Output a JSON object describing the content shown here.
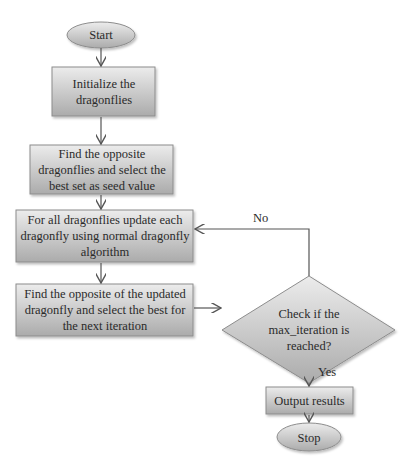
{
  "flowchart": {
    "colors": {
      "fill_light": "#e6e6e6",
      "fill_dark": "#a8a8a8",
      "stroke": "#8c8c8c",
      "line": "#555555"
    },
    "nodes": [
      {
        "id": "start",
        "shape": "ellipse",
        "text": "Start"
      },
      {
        "id": "init",
        "shape": "rect",
        "text": "Initialize the dragonflies"
      },
      {
        "id": "opposite_seed",
        "shape": "rect",
        "text": "Find the opposite dragonflies and select the best set as seed value"
      },
      {
        "id": "update",
        "shape": "rect",
        "text": "For all dragonflies update each dragonfly using normal dragonfly algorithm"
      },
      {
        "id": "opposite_updated",
        "shape": "rect",
        "text": "Find the opposite of the updated dragonfly and select the best for the next iteration"
      },
      {
        "id": "check",
        "shape": "diamond",
        "text": "Check if the max_iteration is reached?"
      },
      {
        "id": "output",
        "shape": "rect",
        "text": "Output results"
      },
      {
        "id": "stop",
        "shape": "ellipse",
        "text": "Stop"
      }
    ],
    "edges": [
      {
        "from": "start",
        "to": "init",
        "label": ""
      },
      {
        "from": "init",
        "to": "opposite_seed",
        "label": ""
      },
      {
        "from": "opposite_seed",
        "to": "update",
        "label": ""
      },
      {
        "from": "update",
        "to": "opposite_updated",
        "label": ""
      },
      {
        "from": "opposite_updated",
        "to": "check",
        "label": ""
      },
      {
        "from": "check",
        "to": "update",
        "label": "No"
      },
      {
        "from": "check",
        "to": "output",
        "label": "Yes"
      },
      {
        "from": "output",
        "to": "stop",
        "label": ""
      }
    ]
  }
}
